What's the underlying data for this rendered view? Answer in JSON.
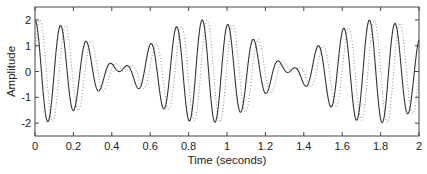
{
  "chart_data": {
    "type": "line",
    "title": "",
    "xlabel": "Time (seconds)",
    "ylabel": "Amplitude",
    "xlim": [
      0,
      2
    ],
    "ylim": [
      -2.5,
      2.5
    ],
    "xticks": [
      0,
      0.2,
      0.4,
      0.6,
      0.8,
      1,
      1.2,
      1.4,
      1.6,
      1.8,
      2
    ],
    "xtick_labels": [
      "0",
      "0.2",
      "0.4",
      "0.6",
      "0.8",
      "1",
      "1.2",
      "1.4",
      "1.6",
      "1.8",
      "2"
    ],
    "yticks": [
      2,
      1,
      0,
      -1,
      -2
    ],
    "ytick_labels": [
      "2",
      "1",
      "0",
      "-1",
      "-2"
    ],
    "grid": false,
    "legend": null,
    "series": [
      {
        "name": "signal",
        "style": "solid",
        "color": "#333333",
        "model": "cos(2*pi*f1*t) + cos(2*pi*f2*t)",
        "f1": 6.9,
        "f2": 8.03,
        "lag": 0,
        "extrema": [
          {
            "t": 0.0,
            "y": 1.95
          },
          {
            "t": 0.065,
            "y": -1.9
          },
          {
            "t": 0.135,
            "y": 1.75
          },
          {
            "t": 0.2,
            "y": -1.5
          },
          {
            "t": 0.27,
            "y": 1.15
          },
          {
            "t": 0.33,
            "y": -0.75
          },
          {
            "t": 0.4,
            "y": 0.3
          },
          {
            "t": 0.48,
            "y": 0.25
          },
          {
            "t": 0.55,
            "y": -0.65
          },
          {
            "t": 0.6,
            "y": 1.1
          },
          {
            "t": 0.68,
            "y": -1.55
          },
          {
            "t": 0.745,
            "y": 1.75
          },
          {
            "t": 0.81,
            "y": -1.95
          },
          {
            "t": 0.875,
            "y": 2.05
          },
          {
            "t": 0.94,
            "y": -2.0
          },
          {
            "t": 1.01,
            "y": 1.9
          },
          {
            "t": 1.075,
            "y": -1.6
          },
          {
            "t": 1.145,
            "y": 1.3
          },
          {
            "t": 1.21,
            "y": -0.85
          },
          {
            "t": 1.275,
            "y": 0.5
          },
          {
            "t": 1.38,
            "y": 0.35
          },
          {
            "t": 1.43,
            "y": -0.55
          },
          {
            "t": 1.49,
            "y": 1.0
          },
          {
            "t": 1.56,
            "y": -1.45
          },
          {
            "t": 1.625,
            "y": 1.6
          },
          {
            "t": 1.69,
            "y": -1.85
          },
          {
            "t": 1.755,
            "y": 2.0
          },
          {
            "t": 1.82,
            "y": -1.95
          },
          {
            "t": 1.89,
            "y": 1.9
          },
          {
            "t": 1.96,
            "y": -1.45
          },
          {
            "t": 2.0,
            "y": 0.1
          }
        ]
      },
      {
        "name": "delayed signal",
        "style": "dotted",
        "color": "#888888",
        "model": "cos(2*pi*f1*(t-lag)) + cos(2*pi*f2*(t-lag))",
        "f1": 6.9,
        "f2": 8.03,
        "lag": 0.026
      }
    ]
  },
  "layout": {
    "plot": {
      "left": 35,
      "top": 7,
      "right": 419,
      "bottom": 136
    },
    "frame_color": "#444444",
    "background": "#ffffff"
  }
}
